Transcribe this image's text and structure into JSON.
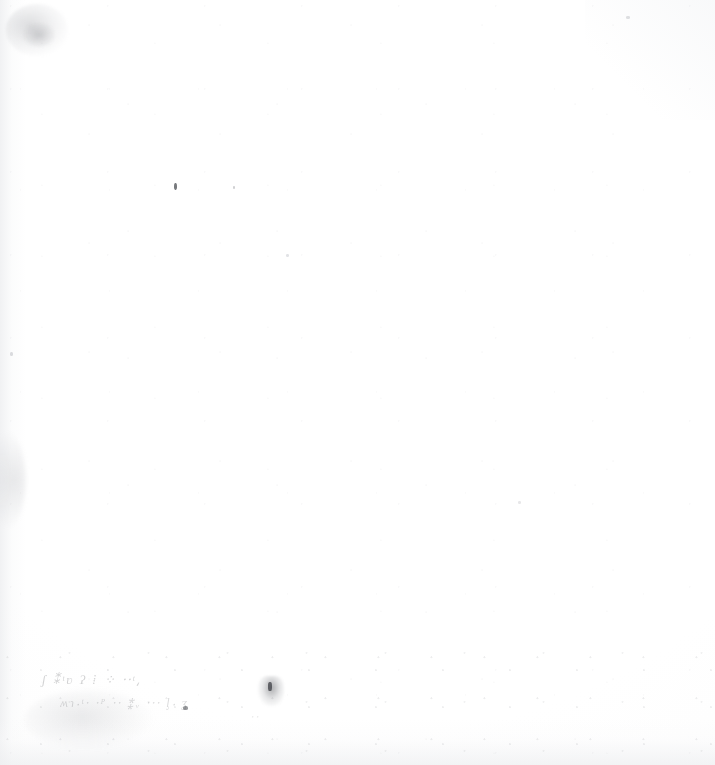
{
  "page": {
    "kind": "scanned-page",
    "width": 715,
    "height": 765,
    "background_color": "#ffffff",
    "paper_tone_color": "#fdfdfd",
    "ink_color": "#3a3c42",
    "visible_text": ""
  },
  "marks": {
    "handwriting": {
      "label": "faded-handwriting",
      "legible": "false",
      "note": "illegible",
      "line1": "ʃ  ⁑ᵗʋ            ʔ   ⁞ ⁘      ⸱⸱ᵗ⸲",
      "line2": "ʍɿ⸳ᵗ⸱     ⸱ᴾ  ⸱⸱  ⁑ᵥ  ⸱⸱⸱ ᶅ⸳  ʓ",
      "line3": "⸱⸱",
      "region": "lower-left"
    },
    "specks": {
      "label": "ink-specks",
      "count": "5"
    },
    "smudges": {
      "label": "paper-smudges",
      "count": "4"
    }
  }
}
